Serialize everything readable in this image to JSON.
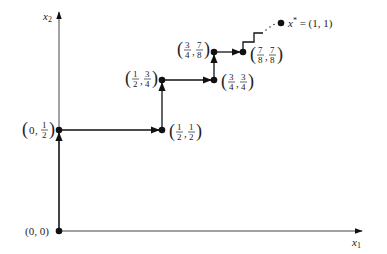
{
  "axes": {
    "x_label": "x",
    "x_sub": "1",
    "y_label": "x",
    "y_sub": "2"
  },
  "points": [
    {
      "id": "p0",
      "label": "(0, 0)",
      "x": 59,
      "y": 231
    },
    {
      "id": "p1",
      "num_a": "0",
      "frac_b": [
        "1",
        "2"
      ],
      "x": 59,
      "y": 130
    },
    {
      "id": "p2",
      "frac_a": [
        "1",
        "2"
      ],
      "frac_b": [
        "1",
        "2"
      ],
      "x": 162,
      "y": 130
    },
    {
      "id": "p3",
      "frac_a": [
        "1",
        "2"
      ],
      "frac_b": [
        "3",
        "4"
      ],
      "x": 162,
      "y": 80
    },
    {
      "id": "p4",
      "frac_a": [
        "3",
        "4"
      ],
      "frac_b": [
        "3",
        "4"
      ],
      "x": 214,
      "y": 80
    },
    {
      "id": "p5",
      "frac_a": [
        "3",
        "4"
      ],
      "frac_b": [
        "7",
        "8"
      ],
      "x": 214,
      "y": 52
    },
    {
      "id": "p6",
      "frac_a": [
        "7",
        "8"
      ],
      "frac_b": [
        "7",
        "8"
      ],
      "x": 243,
      "y": 52
    }
  ],
  "limit": {
    "label_var": "x",
    "label_sup": "*",
    "label_rest": " = (1, 1)",
    "ellipsis": "· · ·",
    "x": 281,
    "y": 23
  },
  "colors": {
    "line": "#111111",
    "axis": "#333333",
    "text": "#222222"
  }
}
